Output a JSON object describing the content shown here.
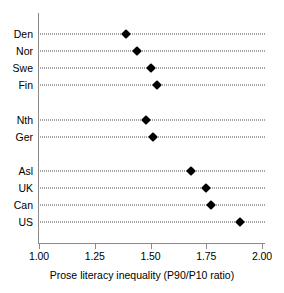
{
  "chart_data": {
    "type": "scatter",
    "orientation": "horizontal",
    "title": "",
    "subtitle": "",
    "xlabel": "Prose literacy inequality (P90/P10 ratio)",
    "ylabel": "",
    "xlim": [
      1.0,
      2.0
    ],
    "xticks": [
      1.0,
      1.25,
      1.5,
      1.75,
      2.0
    ],
    "xtick_labels": [
      "1.00",
      "1.25",
      "1.50",
      "1.75",
      "2.00"
    ],
    "grid": "horizontal-dotted-per-category",
    "legend": "none",
    "marker": "filled-diamond",
    "marker_color": "#000000",
    "categories": [
      "Den",
      "Nor",
      "Swe",
      "Fin",
      "Nth",
      "Ger",
      "Asl",
      "UK",
      "Can",
      "US"
    ],
    "values": [
      1.39,
      1.44,
      1.5,
      1.53,
      1.48,
      1.51,
      1.68,
      1.75,
      1.77,
      1.9
    ],
    "groups": [
      {
        "name": "",
        "categories": [
          "Den",
          "Nor",
          "Swe",
          "Fin"
        ]
      },
      {
        "name": "",
        "categories": [
          "Nth",
          "Ger"
        ]
      },
      {
        "name": "",
        "categories": [
          "Asl",
          "UK",
          "Can",
          "US"
        ]
      }
    ],
    "points": [
      {
        "label": "Den",
        "value": 1.39,
        "y": 34
      },
      {
        "label": "Nor",
        "value": 1.44,
        "y": 51
      },
      {
        "label": "Swe",
        "value": 1.5,
        "y": 68
      },
      {
        "label": "Fin",
        "value": 1.53,
        "y": 85
      },
      {
        "label": "Nth",
        "value": 1.48,
        "y": 120
      },
      {
        "label": "Ger",
        "value": 1.51,
        "y": 137
      },
      {
        "label": "Asl",
        "value": 1.68,
        "y": 171
      },
      {
        "label": "UK",
        "value": 1.75,
        "y": 188
      },
      {
        "label": "Can",
        "value": 1.77,
        "y": 205
      },
      {
        "label": "US",
        "value": 1.9,
        "y": 222
      }
    ]
  },
  "axis": {
    "x_title": "Prose literacy inequality (P90/P10 ratio)",
    "ticks": [
      {
        "label": "1.00",
        "value": 1.0
      },
      {
        "label": "1.25",
        "value": 1.25
      },
      {
        "label": "1.50",
        "value": 1.5
      },
      {
        "label": "1.75",
        "value": 1.75
      },
      {
        "label": "2.00",
        "value": 2.0
      }
    ]
  },
  "colors": {
    "marker": "#000000",
    "axis": "#8a8a8a",
    "guide": "#4d4d4d",
    "text": "#000000",
    "background": "#ffffff"
  }
}
